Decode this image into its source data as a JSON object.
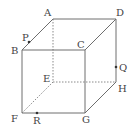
{
  "diagram": {
    "type": "cube",
    "vertices": {
      "A": {
        "label": "A",
        "x": 53,
        "y": 19,
        "label_x": 44,
        "label_y": 16
      },
      "D": {
        "label": "D",
        "x": 116,
        "y": 19,
        "label_x": 116,
        "label_y": 16
      },
      "B": {
        "label": "B",
        "x": 22,
        "y": 50,
        "label_x": 11,
        "label_y": 54
      },
      "C": {
        "label": "C",
        "x": 85,
        "y": 50,
        "label_x": 77,
        "label_y": 48
      },
      "E": {
        "label": "E",
        "x": 53,
        "y": 82,
        "label_x": 43,
        "label_y": 82
      },
      "H": {
        "label": "H",
        "x": 116,
        "y": 82,
        "label_x": 118,
        "label_y": 92
      },
      "F": {
        "label": "F",
        "x": 22,
        "y": 113,
        "label_x": 11,
        "label_y": 122
      },
      "G": {
        "label": "G",
        "x": 85,
        "y": 113,
        "label_x": 82,
        "label_y": 123
      }
    },
    "points": {
      "P": {
        "label": "P",
        "on_edge": "AB",
        "x": 29,
        "y": 42,
        "label_x": 22,
        "label_y": 41
      },
      "Q": {
        "label": "Q",
        "on_edge": "DH",
        "x": 116,
        "y": 67,
        "label_x": 119,
        "label_y": 71
      },
      "R": {
        "label": "R",
        "on_edge": "FG",
        "x": 37,
        "y": 113,
        "label_x": 33,
        "label_y": 124
      }
    },
    "visible_edges": [
      "AD",
      "AB",
      "DC",
      "BC",
      "BF",
      "CG",
      "FG",
      "DH",
      "GH"
    ],
    "hidden_edges": [
      "AE",
      "EF",
      "EH"
    ]
  }
}
